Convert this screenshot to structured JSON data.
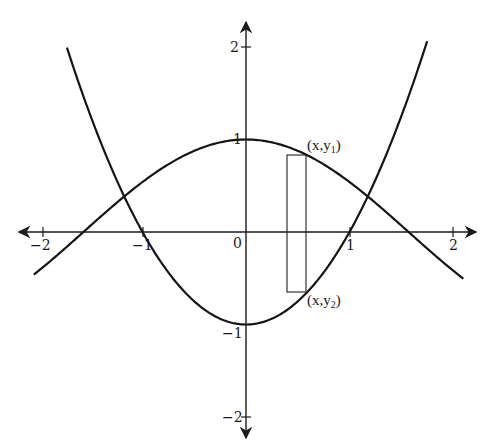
{
  "chart_data": {
    "type": "line",
    "title": "",
    "xlabel": "",
    "ylabel": "",
    "xlim": [
      -2.2,
      2.2
    ],
    "ylim": [
      -2.2,
      2.2
    ],
    "grid": false,
    "x_ticks": [
      -2,
      -1,
      0,
      1,
      2
    ],
    "y_ticks": [
      -2,
      -1,
      1,
      2
    ],
    "x_tick_labels": [
      "−2",
      "−1",
      "0",
      "1",
      "2"
    ],
    "y_tick_labels": [
      "−2",
      "−1",
      "1",
      "2"
    ],
    "series": [
      {
        "name": "y = cos x",
        "x_range": [
          -2.05,
          2.1
        ],
        "peak": [
          0,
          1
        ],
        "zeros": [
          -1.571,
          1.571
        ]
      },
      {
        "name": "y = x^2 - 1",
        "x_range": [
          -1.73,
          1.75
        ],
        "vertex": [
          0,
          -1
        ],
        "zeros": [
          -1,
          1
        ]
      }
    ],
    "intersections": [
      [
        -1.18,
        0.38
      ],
      [
        1.18,
        0.38
      ]
    ],
    "annotations": [
      {
        "type": "rectangle",
        "x_left": 0.4,
        "x_right": 0.58,
        "y_top": 0.836,
        "y_bottom": -0.66
      },
      {
        "text": "(x,y₁)",
        "at": [
          0.58,
          0.836
        ]
      },
      {
        "text": "(x,y₂)",
        "at": [
          0.58,
          -0.66
        ]
      }
    ]
  },
  "labels": {
    "x_m2": "−2",
    "x_m1": "−1",
    "origin": "0",
    "x_1": "1",
    "x_2": "2",
    "y_2": "2",
    "y_1": "1",
    "y_m1": "−1",
    "y_m2": "−2",
    "pt_upper_main": "(x,y",
    "pt_upper_sub": "1",
    "pt_upper_close": ")",
    "pt_lower_main": "(x,y",
    "pt_lower_sub": "2",
    "pt_lower_close": ")"
  }
}
